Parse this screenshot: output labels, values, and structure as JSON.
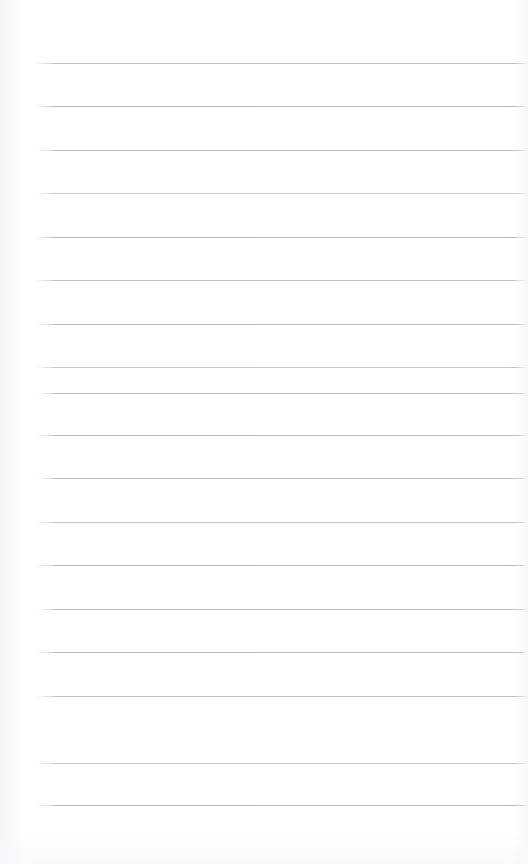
{
  "document": {
    "kind": "lined-notebook-paper",
    "title": "Blank ruled paper page",
    "page_width": 528,
    "page_height": 864,
    "background_color": "#ffffff",
    "content_text": "",
    "has_visible_text": false,
    "has_margin_rule": false,
    "has_holes": false
  },
  "ruling": {
    "line_color": "#b9b9be",
    "line_thickness_px": 1,
    "line_count": 18,
    "first_line_y": 63,
    "last_line_y": 805,
    "line_spacing_px": 43.6,
    "left_margin_x": 52,
    "right_margin_x": 521,
    "top_blank_band_px": 63,
    "bottom_blank_band_px": 59
  },
  "lines": [
    {
      "index": 1,
      "y": 63,
      "x1": 53,
      "x2": 521,
      "tone": "tone-a"
    },
    {
      "index": 2,
      "y": 106,
      "x1": 53,
      "x2": 521,
      "tone": "tone-b"
    },
    {
      "index": 3,
      "y": 150,
      "x1": 53,
      "x2": 520,
      "tone": "tone-a"
    },
    {
      "index": 4,
      "y": 193,
      "x1": 53,
      "x2": 519,
      "tone": "tone-c"
    },
    {
      "index": 5,
      "y": 237,
      "x1": 53,
      "x2": 517,
      "tone": "tone-b"
    },
    {
      "index": 6,
      "y": 280,
      "x1": 53,
      "x2": 516,
      "tone": "tone-a"
    },
    {
      "index": 7,
      "y": 324,
      "x1": 54,
      "x2": 519,
      "tone": "tone-b"
    },
    {
      "index": 8,
      "y": 367,
      "x1": 54,
      "x2": 520,
      "tone": "tone-c"
    },
    {
      "index": 9,
      "y": 393,
      "x1": 54,
      "x2": 521,
      "tone": "tone-a"
    },
    {
      "index": 10,
      "y": 435,
      "x1": 54,
      "x2": 521,
      "tone": "tone-b"
    },
    {
      "index": 11,
      "y": 478,
      "x1": 54,
      "x2": 521,
      "tone": "tone-a"
    },
    {
      "index": 12,
      "y": 522,
      "x1": 54,
      "x2": 522,
      "tone": "tone-c"
    },
    {
      "index": 13,
      "y": 565,
      "x1": 54,
      "x2": 522,
      "tone": "tone-b"
    },
    {
      "index": 14,
      "y": 609,
      "x1": 54,
      "x2": 523,
      "tone": "tone-a"
    },
    {
      "index": 15,
      "y": 652,
      "x1": 54,
      "x2": 523,
      "tone": "tone-b"
    },
    {
      "index": 16,
      "y": 696,
      "x1": 54,
      "x2": 524,
      "tone": "tone-a"
    },
    {
      "index": 17,
      "y": 763,
      "x1": 55,
      "x2": 524,
      "tone": "tone-c"
    },
    {
      "index": 18,
      "y": 805,
      "x1": 55,
      "x2": 525,
      "tone": "tone-b"
    }
  ]
}
